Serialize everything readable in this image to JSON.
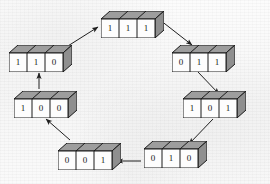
{
  "figure": {
    "node_kind": "3-cell register block",
    "colors": {
      "background": "#fbfbfb",
      "box_front": "#fdfdfd",
      "box_top": "#9d9d9d",
      "box_side": "#8f8f8f",
      "outline": "#1a1a1a",
      "arrow": "#1f1f1f",
      "digit": "#16181a"
    }
  },
  "nodes": [
    {
      "id": "n111",
      "bits": [
        "1",
        "1",
        "1"
      ],
      "label": "111",
      "x": 101,
      "y": 11
    },
    {
      "id": "n011",
      "bits": [
        "0",
        "1",
        "1"
      ],
      "label": "011",
      "x": 172,
      "y": 45
    },
    {
      "id": "n101",
      "bits": [
        "1",
        "0",
        "1"
      ],
      "label": "101",
      "x": 183,
      "y": 91
    },
    {
      "id": "n010",
      "bits": [
        "0",
        "1",
        "0"
      ],
      "label": "010",
      "x": 144,
      "y": 141
    },
    {
      "id": "n001",
      "bits": [
        "0",
        "0",
        "1"
      ],
      "label": "001",
      "x": 58,
      "y": 143
    },
    {
      "id": "n100",
      "bits": [
        "1",
        "0",
        "0"
      ],
      "label": "100",
      "x": 14,
      "y": 91
    },
    {
      "id": "n110",
      "bits": [
        "1",
        "1",
        "0"
      ],
      "label": "110",
      "x": 9,
      "y": 45
    }
  ],
  "transitions": [
    {
      "from": "110",
      "to": "111",
      "direction": "up-right"
    },
    {
      "from": "111",
      "to": "011",
      "direction": "down-right"
    },
    {
      "from": "011",
      "to": "101",
      "direction": "down-right"
    },
    {
      "from": "101",
      "to": "010",
      "direction": "down-left"
    },
    {
      "from": "010",
      "to": "001",
      "direction": "left"
    },
    {
      "from": "001",
      "to": "100",
      "direction": "up-left"
    },
    {
      "from": "100",
      "to": "110",
      "direction": "up"
    }
  ]
}
